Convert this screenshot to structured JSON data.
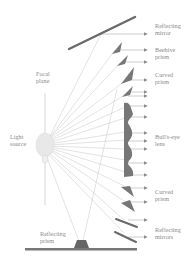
{
  "diagram": {
    "colors": {
      "component": "#6f6f6f",
      "ray": "#b9b9b9",
      "source": "#e6e6e6",
      "label": "#8a8a8a"
    },
    "labels": {
      "reflecting_mirror": "Reflecting\nmirror",
      "beehive_prism": "Beehive\nprism",
      "curved_prism_top": "Curved\nprism",
      "bulls_eye_lens": "Bull's-eye\nlens",
      "curved_prism_bottom": "Curved\nprism",
      "reflecting_mirrors": "Reflecting\nmirrors",
      "focal_plane": "Focal\nplane",
      "light_source": "Light\nsource",
      "reflecting_prism": "Reflecting\nprism"
    }
  }
}
